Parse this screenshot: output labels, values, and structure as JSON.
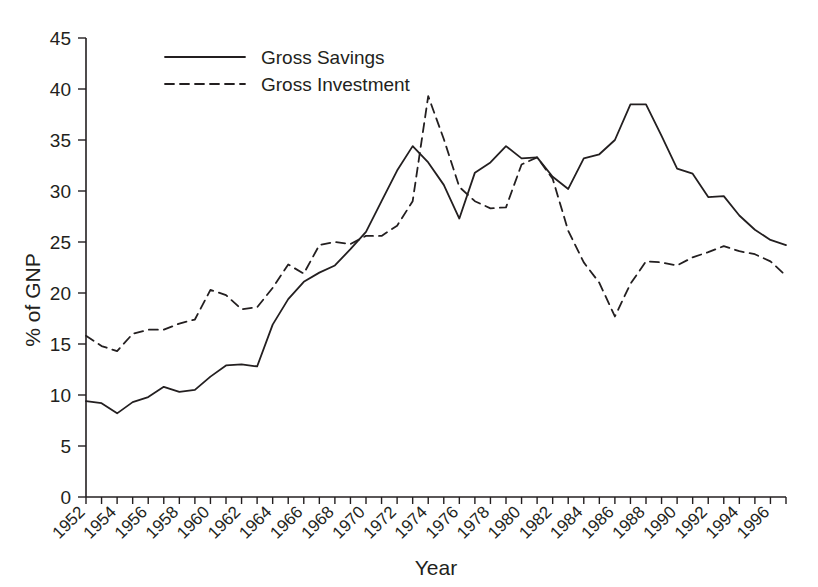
{
  "chart_data": {
    "type": "line",
    "title": "",
    "xlabel": "Year",
    "ylabel": "% of GNP",
    "xlim": [
      1952,
      1997
    ],
    "ylim": [
      0,
      45
    ],
    "ytick_step": 5,
    "xtick_step": 2,
    "grid": false,
    "legend_position": "top-center",
    "yticks": [
      "0",
      "5",
      "10",
      "15",
      "20",
      "25",
      "30",
      "35",
      "40",
      "45"
    ],
    "xticks": [
      "1952",
      "1954",
      "1956",
      "1958",
      "1960",
      "1962",
      "1964",
      "1966",
      "1968",
      "1970",
      "1972",
      "1974",
      "1976",
      "1978",
      "1980",
      "1982",
      "1984",
      "1986",
      "1988",
      "1990",
      "1992",
      "1994",
      "1996"
    ],
    "x": [
      1952,
      1953,
      1954,
      1955,
      1956,
      1957,
      1958,
      1959,
      1960,
      1961,
      1962,
      1963,
      1964,
      1965,
      1966,
      1967,
      1968,
      1969,
      1970,
      1971,
      1972,
      1973,
      1974,
      1975,
      1976,
      1977,
      1978,
      1979,
      1980,
      1981,
      1982,
      1983,
      1984,
      1985,
      1986,
      1987,
      1988,
      1989,
      1990,
      1991,
      1992,
      1993,
      1994,
      1995,
      1996,
      1997
    ],
    "series": [
      {
        "name": "Gross Savings",
        "style": "solid",
        "color": "#231f20",
        "values": [
          9.4,
          9.2,
          8.2,
          9.3,
          9.8,
          10.8,
          10.3,
          10.5,
          11.8,
          12.9,
          13.0,
          12.8,
          16.9,
          19.4,
          21.1,
          22.0,
          22.7,
          24.3,
          26.0,
          29.0,
          32.0,
          34.4,
          32.8,
          30.6,
          27.3,
          31.8,
          32.8,
          34.4,
          33.2,
          33.3,
          31.4,
          30.2,
          33.2,
          33.6,
          35.0,
          38.5,
          38.5,
          35.4,
          32.2,
          31.7,
          29.4,
          29.5,
          27.6,
          26.2,
          25.2,
          24.7
        ]
      },
      {
        "name": "Gross Investment",
        "style": "dashed",
        "color": "#231f20",
        "values": [
          15.8,
          14.8,
          14.3,
          16.0,
          16.4,
          16.4,
          17.0,
          17.4,
          20.3,
          19.8,
          18.4,
          18.6,
          20.5,
          22.8,
          21.9,
          24.7,
          25.0,
          24.8,
          25.6,
          25.6,
          26.6,
          29.0,
          39.3,
          35.1,
          30.4,
          29.0,
          28.3,
          28.4,
          32.6,
          33.3,
          31.2,
          26.1,
          23.0,
          21.0,
          17.7,
          20.9,
          23.1,
          23.0,
          22.7,
          23.5,
          24.0,
          24.6,
          24.1,
          23.8,
          23.1,
          21.7
        ]
      }
    ]
  },
  "legend": {
    "items": [
      {
        "label": "Gross Savings",
        "style": "solid"
      },
      {
        "label": "Gross Investment",
        "style": "dashed"
      }
    ]
  },
  "axes": {
    "x_title": "Year",
    "y_title": "% of GNP"
  }
}
